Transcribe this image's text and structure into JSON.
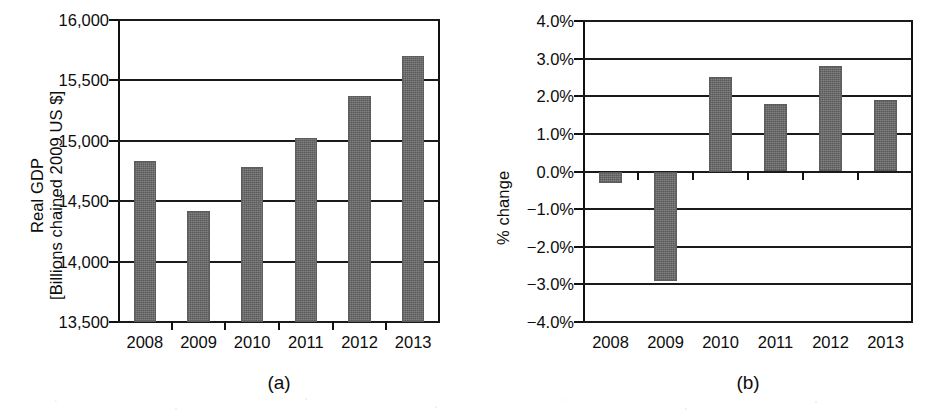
{
  "figure": {
    "panels": [
      {
        "key": "a",
        "caption": "(a)",
        "ylabel_line1": "Real GDP",
        "ylabel_line2": "[Billions chained 2009 US $]"
      },
      {
        "key": "b",
        "caption": "(b)",
        "ylabel_line1": "% change",
        "ylabel_line2": ""
      }
    ]
  },
  "chart_data": [
    {
      "type": "bar",
      "panel": "a",
      "title": "",
      "xlabel": "",
      "ylabel": "Real GDP [Billions chained 2009 US $]",
      "categories": [
        "2008",
        "2009",
        "2010",
        "2011",
        "2012",
        "2013"
      ],
      "values": [
        14835,
        14420,
        14780,
        15020,
        15370,
        15700
      ],
      "ylim": [
        13500,
        16000
      ],
      "ytick_values": [
        16000,
        15500,
        15000,
        14500,
        14000,
        13500
      ],
      "ytick_labels": [
        "16,000",
        "15,500",
        "15,000",
        "14,500",
        "14,000",
        "13,500"
      ],
      "grid": true,
      "legend": "none",
      "bar_color": "#6e6e6e",
      "axis_color": "#111111"
    },
    {
      "type": "bar",
      "panel": "b",
      "title": "",
      "xlabel": "",
      "ylabel": "% change",
      "categories": [
        "2008",
        "2009",
        "2010",
        "2011",
        "2012",
        "2013"
      ],
      "values": [
        -0.3,
        -2.9,
        2.5,
        1.8,
        2.8,
        1.9
      ],
      "value_labels": [
        "-0.3%",
        "-2.9%",
        "2.5%",
        "1.8%",
        "2.8%",
        "1.9%"
      ],
      "ylim": [
        -4.0,
        4.0
      ],
      "ytick_values": [
        4.0,
        3.0,
        2.0,
        1.0,
        0.0,
        -1.0,
        -2.0,
        -3.0,
        -4.0
      ],
      "ytick_labels": [
        "4.0%",
        "3.0%",
        "2.0%",
        "1.0%",
        "0.0%",
        "−1.0%",
        "−2.0%",
        "−3.0%",
        "−4.0%"
      ],
      "grid": true,
      "legend": "none",
      "bar_color": "#6e6e6e",
      "axis_color": "#111111"
    }
  ]
}
